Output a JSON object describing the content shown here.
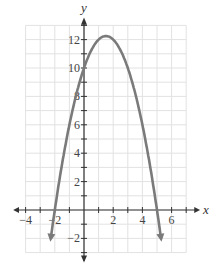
{
  "chart_data": {
    "type": "line",
    "title": "",
    "xlabel": "x",
    "ylabel": "y",
    "xlim": [
      -4.2,
      7.2
    ],
    "ylim": [
      -3.4,
      13.3
    ],
    "grid": true,
    "x_ticks": [
      -4,
      -3,
      -2,
      -1,
      1,
      2,
      3,
      4,
      5,
      6,
      7
    ],
    "x_tick_labels": [
      {
        "value": -4,
        "label": "−4"
      },
      {
        "value": -2,
        "label": "−2"
      },
      {
        "value": 2,
        "label": "2"
      },
      {
        "value": 4,
        "label": "4"
      },
      {
        "value": 6,
        "label": "6"
      }
    ],
    "y_ticks": [
      -3,
      -2,
      -1,
      1,
      2,
      3,
      4,
      5,
      6,
      7,
      8,
      9,
      10,
      11,
      12,
      13
    ],
    "y_tick_labels": [
      {
        "value": -2,
        "label": "−2"
      },
      {
        "value": 2,
        "label": "2"
      },
      {
        "value": 4,
        "label": "4"
      },
      {
        "value": 6,
        "label": "6"
      },
      {
        "value": 8,
        "label": "8"
      },
      {
        "value": 10,
        "label": "10"
      },
      {
        "value": 12,
        "label": "12"
      }
    ],
    "series": [
      {
        "name": "parabola",
        "equation": "y = -x^2 + 3x + 10",
        "color": "#7a7a7a",
        "x_range": [
          -2.25,
          5.25
        ],
        "end_arrows": true,
        "key_points": [
          {
            "x": -2,
            "y": 0,
            "note": "x-intercept"
          },
          {
            "x": 0,
            "y": 10,
            "note": "y-intercept"
          },
          {
            "x": 1.5,
            "y": 12.25,
            "note": "vertex"
          },
          {
            "x": 5,
            "y": 0,
            "note": "x-intercept"
          }
        ]
      }
    ]
  },
  "style": {
    "grid_color": "#e2e2e2",
    "axis_color": "#333333",
    "curve_color": "#7a7a7a",
    "background": "#ffffff"
  }
}
